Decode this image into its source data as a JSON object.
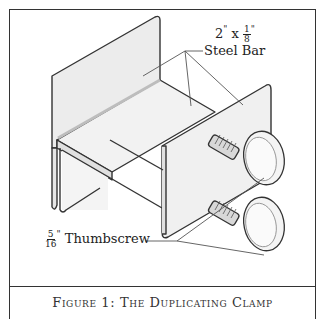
{
  "figure": {
    "caption": "Figure 1:  The Duplicating Clamp",
    "labels": {
      "steel_bar": {
        "whole": "2",
        "unit": "\"",
        "times": "x",
        "frac_num": "1",
        "frac_den": "8",
        "frac_unit": "\"",
        "name": "Steel Bar"
      },
      "thumbscrew": {
        "frac_num": "5",
        "frac_den": "16",
        "frac_unit": "\"",
        "name": "Thumbscrew"
      }
    },
    "colors": {
      "line": "#333333",
      "fill_light": "#efefef",
      "fill_mid": "#e2e2e2",
      "shade": "#bdbdbd"
    }
  }
}
